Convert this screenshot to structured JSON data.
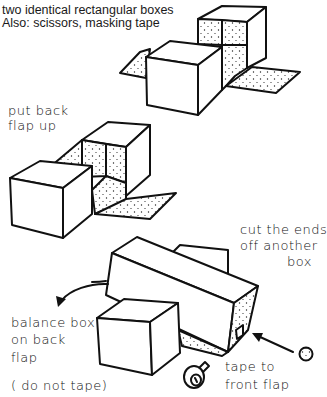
{
  "header": {
    "materials_line1": "two identical rectangular boxes",
    "materials_line2": "Also: scissors, masking tape"
  },
  "steps": [
    {
      "id": "step-1",
      "figure": "two boxes with open flaps: one box in front, one behind showing dotted interior, side flaps extended",
      "labels": []
    },
    {
      "id": "step-2",
      "labels": [
        "put back",
        "flap up"
      ]
    },
    {
      "id": "step-3",
      "labels": {
        "cut_ends": [
          "cut the ends",
          "off another",
          "box"
        ],
        "balance": [
          "balance box",
          "on back",
          "flap"
        ],
        "do_not_tape": "( do not tape)",
        "tape_front": [
          "tape to",
          "front flap"
        ]
      }
    }
  ],
  "icons": {
    "tape_roll": "tape-roll-icon",
    "arrow_curved": "curved-arrow-icon",
    "arrow_straight": "straight-arrow-icon",
    "circle_ball": "ball-icon"
  },
  "colors": {
    "ink": "#111111",
    "paper": "#ffffff",
    "stipple": "#222222"
  }
}
